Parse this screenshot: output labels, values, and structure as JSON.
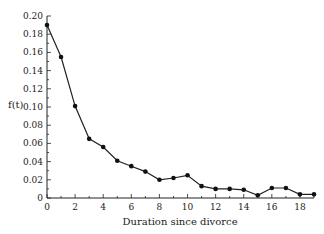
{
  "chart_data": {
    "type": "line",
    "title": "",
    "xlabel": "Duration since divorce",
    "ylabel": "f(t)",
    "xlim": [
      0,
      19
    ],
    "ylim": [
      0,
      0.2
    ],
    "xticks": [
      "0",
      "2",
      "4",
      "6",
      "8",
      "10",
      "12",
      "14",
      "16",
      "18"
    ],
    "yticks": [
      "0",
      "0.02",
      "0.04",
      "0.06",
      "0.08",
      "0.10",
      "0.12",
      "0.14",
      "0.16",
      "0.18",
      "0.20"
    ],
    "grid": false,
    "series": [
      {
        "name": "f(t)",
        "x": [
          0,
          1,
          2,
          3,
          4,
          5,
          6,
          7,
          8,
          9,
          10,
          11,
          12,
          13,
          14,
          15,
          16,
          17,
          18,
          19
        ],
        "y": [
          0.19,
          0.155,
          0.101,
          0.065,
          0.056,
          0.041,
          0.035,
          0.029,
          0.02,
          0.022,
          0.025,
          0.013,
          0.01,
          0.01,
          0.009,
          0.003,
          0.011,
          0.011,
          0.004,
          0.004
        ]
      }
    ]
  }
}
